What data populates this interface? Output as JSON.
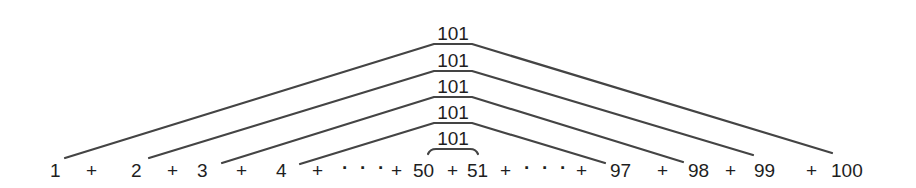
{
  "diagram": {
    "pair_sum_label": "101",
    "pair_labels": [
      "101",
      "101",
      "101",
      "101",
      "101"
    ],
    "sequence": {
      "terms": [
        {
          "text": "1",
          "x": 50
        },
        {
          "text": "+",
          "x": 86
        },
        {
          "text": "2",
          "x": 131
        },
        {
          "text": "+",
          "x": 167
        },
        {
          "text": "3",
          "x": 197
        },
        {
          "text": "+",
          "x": 236
        },
        {
          "text": "4",
          "x": 276
        },
        {
          "text": "+",
          "x": 312
        },
        {
          "text": "·",
          "x": 342
        },
        {
          "text": "·",
          "x": 360
        },
        {
          "text": "·",
          "x": 378
        },
        {
          "text": "+",
          "x": 391
        },
        {
          "text": "50",
          "x": 413
        },
        {
          "text": "+",
          "x": 447
        },
        {
          "text": "51",
          "x": 467
        },
        {
          "text": "+",
          "x": 500
        },
        {
          "text": "·",
          "x": 524
        },
        {
          "text": "·",
          "x": 542
        },
        {
          "text": "·",
          "x": 560
        },
        {
          "text": "+",
          "x": 576
        },
        {
          "text": "97",
          "x": 610
        },
        {
          "text": "+",
          "x": 657
        },
        {
          "text": "98",
          "x": 688
        },
        {
          "text": "+",
          "x": 725
        },
        {
          "text": "99",
          "x": 754
        },
        {
          "text": "+",
          "x": 806
        },
        {
          "text": "100",
          "x": 831
        }
      ]
    },
    "pairs": [
      {
        "left": "1",
        "right": "100",
        "sum": "101"
      },
      {
        "left": "2",
        "right": "99",
        "sum": "101"
      },
      {
        "left": "3",
        "right": "98",
        "sum": "101"
      },
      {
        "left": "4",
        "right": "97",
        "sum": "101"
      },
      {
        "left": "50",
        "right": "51",
        "sum": "101"
      }
    ],
    "colors": {
      "text": "#1e1e1e",
      "lines": "#444444",
      "background": "#ffffff"
    }
  }
}
